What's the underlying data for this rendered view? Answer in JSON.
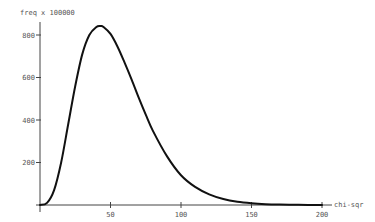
{
  "chart_data": {
    "type": "line",
    "title": "",
    "xlabel": "chi-sqr",
    "ylabel": "freq x 100000",
    "xlim": [
      0,
      200
    ],
    "ylim": [
      0,
      800
    ],
    "grid": false,
    "legend": null,
    "x_ticks": [
      50,
      100,
      150,
      200
    ],
    "y_ticks": [
      200,
      400,
      600,
      800
    ],
    "series": [
      {
        "name": "chi-sqr frequency",
        "x": [
          0,
          5,
          10,
          15,
          20,
          25,
          30,
          35,
          40,
          43,
          45,
          50,
          55,
          60,
          65,
          70,
          75,
          80,
          90,
          100,
          110,
          120,
          130,
          140,
          150,
          160,
          170,
          180,
          190,
          200
        ],
        "values": [
          0,
          10,
          70,
          200,
          380,
          560,
          710,
          800,
          838,
          842,
          838,
          805,
          745,
          670,
          590,
          505,
          425,
          350,
          230,
          140,
          85,
          50,
          28,
          15,
          8,
          4,
          2,
          1,
          0,
          0
        ]
      }
    ]
  },
  "axes": {
    "y_title": "freq x 100000",
    "x_title": "chi-sqr",
    "y_tick_labels": [
      "200",
      "400",
      "600",
      "800"
    ],
    "x_tick_labels": [
      "50",
      "100",
      "150",
      "200"
    ]
  },
  "colors": {
    "curve": "#111111",
    "axis": "#444444",
    "text": "#555555"
  }
}
